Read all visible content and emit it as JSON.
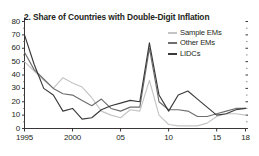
{
  "chart_data": {
    "type": "line",
    "title": "2. Share of Countries with Double-Digit Inflation",
    "panel_number": "2.",
    "xlabel": "",
    "ylabel": "",
    "xlim": [
      1995,
      2018
    ],
    "ylim": [
      0,
      80
    ],
    "grid": false,
    "legend_position": "top-right",
    "y_ticks": [
      0,
      10,
      20,
      30,
      40,
      50,
      60,
      70,
      80
    ],
    "y_tick_labels": [
      "0",
      "10",
      "20",
      "30",
      "40",
      "50",
      "60",
      "70",
      "80"
    ],
    "x_ticks": [
      1995,
      2000,
      2005,
      2010,
      2015,
      2018
    ],
    "x_tick_labels": [
      "1995",
      "2000",
      "05",
      "10",
      "15",
      "18"
    ],
    "x": [
      1995,
      1996,
      1997,
      1998,
      1999,
      2000,
      2001,
      2002,
      2003,
      2004,
      2005,
      2006,
      2007,
      2008,
      2009,
      2010,
      2011,
      2012,
      2013,
      2014,
      2015,
      2016,
      2017,
      2018
    ],
    "series": [
      {
        "name": "Sample EMs",
        "color": "#c4c4c4",
        "values": [
          50,
          43,
          36,
          30,
          38,
          34,
          31,
          23,
          13,
          10,
          8,
          14,
          13,
          36,
          10,
          3,
          2,
          2,
          2,
          4,
          9,
          11,
          11,
          10
        ]
      },
      {
        "name": "Other EMs",
        "color": "#6e6e6e",
        "values": [
          57,
          44,
          37,
          30,
          26,
          25,
          21,
          17,
          22,
          15,
          13,
          16,
          16,
          60,
          20,
          14,
          14,
          13,
          9,
          9,
          11,
          13,
          15,
          15
        ]
      },
      {
        "name": "LIDCs",
        "color": "#3a3a3a",
        "values": [
          70,
          48,
          30,
          25,
          13,
          15,
          7,
          8,
          14,
          17,
          19,
          21,
          20,
          64,
          25,
          13,
          25,
          28,
          22,
          16,
          10,
          11,
          14,
          15
        ]
      }
    ]
  },
  "legend": {
    "entries": [
      {
        "label": "Sample EMs",
        "color": "#c4c4c4"
      },
      {
        "label": "Other EMs",
        "color": "#6e6e6e"
      },
      {
        "label": "LIDCs",
        "color": "#3a3a3a"
      }
    ]
  },
  "axis": {
    "y_top_label": "80",
    "y_labels": [
      "70",
      "60",
      "50",
      "40",
      "30",
      "20",
      "10",
      "0"
    ],
    "x_labels": [
      "1995",
      "2000",
      "05",
      "10",
      "15",
      "18"
    ]
  }
}
